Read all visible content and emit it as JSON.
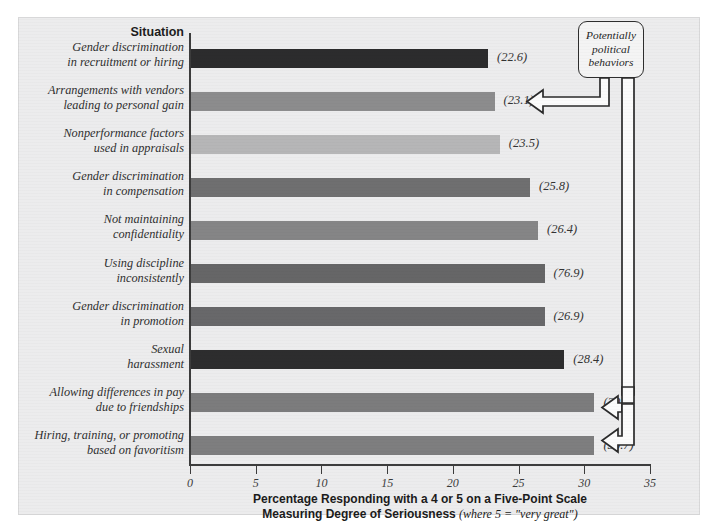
{
  "chart_data": {
    "type": "bar",
    "orientation": "horizontal",
    "title": "",
    "column_header": "Situation",
    "xlabel_line1": "Percentage Responding with a 4 or 5 on a Five-Point Scale",
    "xlabel_line2_bold": "Measuring Degree of Seriousness",
    "xlabel_line2_italic": "(where 5 = \"very great\")",
    "ylabel": "Situation",
    "xlim": [
      0,
      35
    ],
    "grid": false,
    "legend": false,
    "tick_labels": [
      "0",
      "5",
      "10",
      "15",
      "20",
      "25",
      "30",
      "35"
    ],
    "ticks": [
      0,
      5,
      10,
      15,
      20,
      25,
      30,
      35
    ],
    "categories": [
      "Gender discrimination\nin recruitment or hiring",
      "Arrangements with vendors\nleading to personal gain",
      "Nonperformance factors\nused in appraisals",
      "Gender discrimination\nin compensation",
      "Not maintaining\nconfidentiality",
      "Using discipline\ninconsistently",
      "Gender discrimination\nin promotion",
      "Sexual\nharassment",
      "Allowing differences in pay\ndue to friendships",
      "Hiring, training, or promoting\nbased on favoritism"
    ],
    "values": [
      22.6,
      23.1,
      23.5,
      25.8,
      26.4,
      26.9,
      26.9,
      28.4,
      30.7,
      30.7
    ],
    "value_labels": [
      "(22.6)",
      "(23.1)",
      "(23.5)",
      "(25.8)",
      "(26.4)",
      "(76.9)",
      "(26.9)",
      "(28.4)",
      "(30.7)",
      "(30.7)"
    ],
    "bar_colors": [
      "#2c2c2d",
      "#8c8c8d",
      "#b6b6b7",
      "#6f6f70",
      "#858586",
      "#666667",
      "#68686a",
      "#2d2d2e",
      "#7c7c7d",
      "#7e7e7f"
    ],
    "annotation": {
      "text_line1": "Potentially",
      "text_line2": "political",
      "text_line3": "behaviors",
      "points_to": [
        "(23.1)",
        "(30.7)",
        "(30.7)"
      ]
    },
    "colors": {
      "panel_background": "#ececed",
      "axis": "#3c3c3c",
      "text": "#2f2f2f"
    }
  },
  "bars": [
    {
      "label_line1": "Gender discrimination",
      "label_line2": "in recruitment or hiring",
      "value": 22.6,
      "value_label": "(22.6)",
      "color": "#2c2c2d"
    },
    {
      "label_line1": "Arrangements with vendors",
      "label_line2": "leading to personal gain",
      "value": 23.1,
      "value_label": "(23.1)",
      "color": "#8c8c8d"
    },
    {
      "label_line1": "Nonperformance factors",
      "label_line2": "used in appraisals",
      "value": 23.5,
      "value_label": "(23.5)",
      "color": "#b6b6b7"
    },
    {
      "label_line1": "Gender discrimination",
      "label_line2": "in compensation",
      "value": 25.8,
      "value_label": "(25.8)",
      "color": "#6f6f70"
    },
    {
      "label_line1": "Not maintaining",
      "label_line2": "confidentiality",
      "value": 26.4,
      "value_label": "(26.4)",
      "color": "#858586"
    },
    {
      "label_line1": "Using discipline",
      "label_line2": "inconsistently",
      "value": 26.9,
      "value_label": "(76.9)",
      "color": "#666667"
    },
    {
      "label_line1": "Gender discrimination",
      "label_line2": "in promotion",
      "value": 26.9,
      "value_label": "(26.9)",
      "color": "#68686a"
    },
    {
      "label_line1": "Sexual",
      "label_line2": "harassment",
      "value": 28.4,
      "value_label": "(28.4)",
      "color": "#2d2d2e"
    },
    {
      "label_line1": "Allowing differences in pay",
      "label_line2": "due to friendships",
      "value": 30.7,
      "value_label": "(30.7)",
      "color": "#7c7c7d"
    },
    {
      "label_line1": "Hiring, training, or promoting",
      "label_line2": "based on favoritism",
      "value": 30.7,
      "value_label": "(30.7)",
      "color": "#7e7e7f"
    }
  ],
  "header": {
    "situation": "Situation"
  },
  "axis": {
    "ticks": [
      "0",
      "5",
      "10",
      "15",
      "20",
      "25",
      "30",
      "35"
    ],
    "title_line1": "Percentage Responding with a 4 or 5 on a Five-Point Scale",
    "title_line2_bold": "Measuring Degree of Seriousness",
    "title_line2_italic": "(where 5 = \"very great\")"
  },
  "callout": {
    "line1": "Potentially",
    "line2": "political",
    "line3": "behaviors"
  }
}
